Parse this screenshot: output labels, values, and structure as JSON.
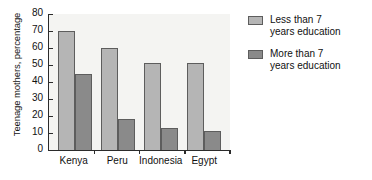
{
  "chart_data": {
    "type": "bar",
    "title": "",
    "xlabel": "",
    "ylabel": "Teenage mothers, percentage",
    "categories": [
      "Kenya",
      "Peru",
      "Indonesia",
      "Egypt"
    ],
    "series": [
      {
        "name": "Less than 7 years education",
        "values": [
          70,
          60,
          51,
          51
        ],
        "color": "#b5b5b5"
      },
      {
        "name": "More than 7 years education",
        "values": [
          45,
          18,
          13,
          11
        ],
        "color": "#8a8a8a"
      }
    ],
    "ylim": [
      0,
      80
    ],
    "yticks": [
      0,
      10,
      20,
      30,
      40,
      50,
      60,
      70,
      80
    ],
    "ytick_labels": [
      "0",
      "10",
      "20",
      "30",
      "40",
      "50",
      "60",
      "70",
      "80"
    ],
    "grid": false,
    "legend_position": "right"
  },
  "legend": {
    "entries": [
      {
        "line1": "Less than 7",
        "line2": "years education",
        "swatch": "light-gray"
      },
      {
        "line1": "More than 7",
        "line2": "years education",
        "swatch": "dark-gray"
      }
    ]
  },
  "colors": {
    "series1": "#b5b5b5",
    "series2": "#8a8a8a",
    "axis": "#2b2b2b",
    "plot_background": "#f4f4f2",
    "bar_border": "#5d5d5d"
  }
}
